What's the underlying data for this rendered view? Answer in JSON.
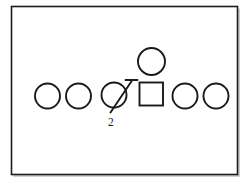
{
  "figure": {
    "background_color": "#ffffff",
    "stroke_color": "#1a1a1a",
    "frame": {
      "name": "diagram-border",
      "x": 11,
      "y": 6,
      "width": 226,
      "height": 168
    },
    "nodes": [
      {
        "id": "sibling-1",
        "shape": "circle",
        "label": "",
        "cx": 47.5,
        "cy": 96,
        "r": 12.5
      },
      {
        "id": "sibling-2",
        "shape": "circle",
        "label": "",
        "cx": 78.5,
        "cy": 96,
        "r": 12.5
      },
      {
        "id": "sibling-3-marked",
        "shape": "circle",
        "label": "",
        "cx": 114,
        "cy": 95,
        "r": 12.5
      },
      {
        "id": "ego-square",
        "shape": "square",
        "label": "",
        "x": 139,
        "y": 82,
        "size": 24
      },
      {
        "id": "spouse-above",
        "shape": "circle",
        "label": "",
        "cx": 151.5,
        "cy": 61.5,
        "r": 13.5
      },
      {
        "id": "sibling-4",
        "shape": "circle",
        "label": "",
        "cx": 185,
        "cy": 96,
        "r": 12.5
      },
      {
        "id": "sibling-5",
        "shape": "circle",
        "label": "",
        "cx": 216,
        "cy": 96,
        "r": 12.5
      }
    ],
    "marker": {
      "name": "diagonal-stroke-marker",
      "description": "diagonal line with horizontal cap over third circle",
      "line_x1": 112,
      "line_y1": 112,
      "line_x2": 132,
      "line_y2": 81,
      "cap_x1": 126,
      "cap_y1": 80,
      "cap_x2": 137,
      "cap_y2": 80
    },
    "annotations": [
      {
        "name": "sibling-count-label",
        "text": "2",
        "x": 108,
        "y": 126
      }
    ]
  }
}
